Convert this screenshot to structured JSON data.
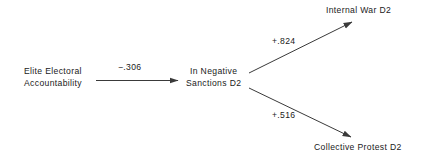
{
  "diagram": {
    "type": "path-diagram",
    "background_color": "#ffffff",
    "line_color": "#3a3a3a",
    "text_color": "#1a1a1a",
    "nodes": [
      {
        "id": "elite-electoral-accountability",
        "line1": "Elite Electoral",
        "line2": "Accountability"
      },
      {
        "id": "in-negative-sanctions",
        "line1": "In Negative",
        "line2": "Sanctions D2"
      },
      {
        "id": "internal-war",
        "line1": "Internal War D2",
        "line2": ""
      },
      {
        "id": "collective-protest",
        "line1": "Collective Protest D2",
        "line2": ""
      }
    ],
    "edges": [
      {
        "id": "accountability-to-sanctions",
        "from": "elite-electoral-accountability",
        "to": "in-negative-sanctions",
        "coefficient": "−.306",
        "sign": "negative",
        "value": -0.306
      },
      {
        "id": "sanctions-to-internal-war",
        "from": "in-negative-sanctions",
        "to": "internal-war",
        "coefficient": "+.824",
        "sign": "positive",
        "value": 0.824
      },
      {
        "id": "sanctions-to-collective-protest",
        "from": "in-negative-sanctions",
        "to": "collective-protest",
        "coefficient": "+.516",
        "sign": "positive",
        "value": 0.516
      }
    ]
  }
}
